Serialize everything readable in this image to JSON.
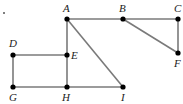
{
  "diagram": {
    "width": 183,
    "height": 104,
    "edge_color": "#7a7a7a",
    "node_color": "#000000",
    "nodes": [
      {
        "id": "A",
        "label": "A",
        "x": 67,
        "y": 19,
        "lx": 63,
        "ly": 12
      },
      {
        "id": "B",
        "label": "B",
        "x": 123,
        "y": 19,
        "lx": 119,
        "ly": 12
      },
      {
        "id": "C",
        "label": "C",
        "x": 178,
        "y": 19,
        "lx": 174,
        "ly": 12
      },
      {
        "id": "D",
        "label": "D",
        "x": 13,
        "y": 55,
        "lx": 9,
        "ly": 47
      },
      {
        "id": "E",
        "label": "E",
        "x": 67,
        "y": 55,
        "lx": 71,
        "ly": 59
      },
      {
        "id": "F",
        "label": "F",
        "x": 178,
        "y": 53,
        "lx": 174,
        "ly": 67
      },
      {
        "id": "G",
        "label": "G",
        "x": 13,
        "y": 87,
        "lx": 9,
        "ly": 101
      },
      {
        "id": "H",
        "label": "H",
        "x": 67,
        "y": 87,
        "lx": 62,
        "ly": 101
      },
      {
        "id": "I",
        "label": "I",
        "x": 123,
        "y": 87,
        "lx": 121,
        "ly": 101
      }
    ],
    "edges": [
      [
        "A",
        "B"
      ],
      [
        "B",
        "C"
      ],
      [
        "C",
        "F"
      ],
      [
        "B",
        "F"
      ],
      [
        "A",
        "E"
      ],
      [
        "E",
        "H"
      ],
      [
        "A",
        "I"
      ],
      [
        "D",
        "E"
      ],
      [
        "D",
        "G"
      ],
      [
        "G",
        "H"
      ],
      [
        "H",
        "I"
      ]
    ],
    "stray_mark": {
      "x": 4,
      "y": 13
    }
  }
}
